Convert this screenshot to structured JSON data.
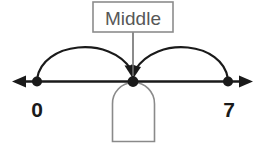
{
  "diagram": {
    "type": "number-line-midpoint",
    "background_color": "#ffffff",
    "line_color": "#1a1a1a",
    "arc_color": "#1a1a1a",
    "callout_border_color": "#8c8c8c",
    "callout_text_color": "#575757",
    "dome_color": "#7a7a7a",
    "callout": {
      "label": "Middle"
    },
    "number_line": {
      "left_arrow": "arrow-left",
      "right_arrow": "arrow-right",
      "points": [
        {
          "label": "0",
          "name": "point-zero",
          "x": 37
        },
        {
          "label": "",
          "name": "point-middle",
          "x": 133
        },
        {
          "label": "7",
          "name": "point-seven",
          "x": 228
        }
      ]
    },
    "arcs": [
      {
        "name": "arc-from-zero-to-middle",
        "from": "0",
        "to": "Middle",
        "direction": "right"
      },
      {
        "name": "arc-from-seven-to-middle",
        "from": "7",
        "to": "Middle",
        "direction": "left"
      }
    ],
    "dome": {
      "name": "dome-shape",
      "description": "arch"
    }
  }
}
